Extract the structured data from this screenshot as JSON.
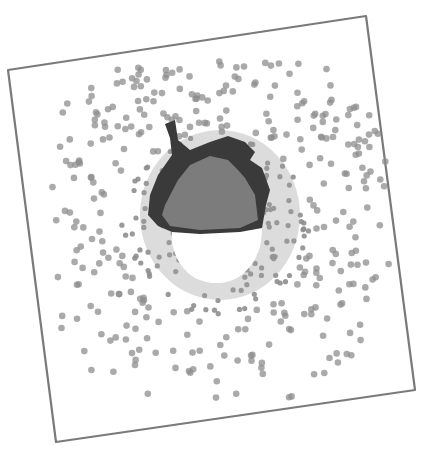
{
  "image": {
    "description": "Pencil drawing of an acorn surrounded by a radial halo of gray dots, inside a slightly tilted hand-drawn square frame",
    "colors": {
      "background": "#ffffff",
      "frame": "#7a7a7a",
      "dots": "#8e8e8e",
      "cap": "#3a3a3a",
      "cap_inner": "#7c7c7c",
      "nut": "#ffffff"
    }
  }
}
